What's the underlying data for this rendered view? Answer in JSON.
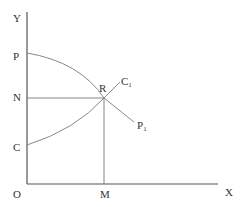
{
  "diagram": {
    "axes": {
      "y_label": "Y",
      "x_label": "X",
      "origin_label": "O"
    },
    "points": {
      "P": "P",
      "N": "N",
      "C": "C",
      "M": "M",
      "R": "R"
    },
    "curves": {
      "C1": {
        "base": "C",
        "sub": "1"
      },
      "P1": {
        "base": "P",
        "sub": "1"
      }
    },
    "colors": {
      "axis": "#555555",
      "curve": "#888888",
      "text": "#333333"
    }
  }
}
